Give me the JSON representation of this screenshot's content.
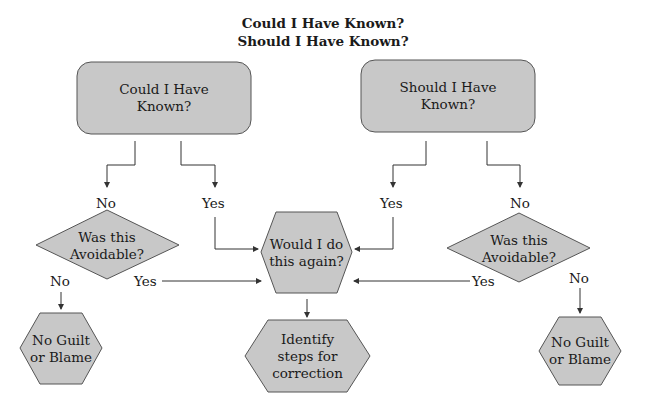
{
  "title": {
    "line1": "Could I Have Known?",
    "line2": "Should I Have Known?"
  },
  "colors": {
    "node_fill": "#c8c8c8",
    "node_stroke": "#555555",
    "line": "#333333",
    "background": "#ffffff"
  },
  "nodes": {
    "could_box": {
      "line1": "Could I Have",
      "line2": "Known?"
    },
    "should_box": {
      "line1": "Should I Have",
      "line2": "Known?"
    },
    "left_diamond": {
      "line1": "Was this",
      "line2": "Avoidable?"
    },
    "right_diamond": {
      "line1": "Was this",
      "line2": "Avoidable?"
    },
    "again_hex": {
      "line1": "Would I do",
      "line2": "this again?"
    },
    "identify_hex": {
      "line1": "Identify",
      "line2": "steps for",
      "line3": "correction"
    },
    "left_guilt_hex": {
      "line1": "No Guilt",
      "line2": "or Blame"
    },
    "right_guilt_hex": {
      "line1": "No Guilt",
      "line2": "or Blame"
    }
  },
  "labels": {
    "could_no": "No",
    "could_yes": "Yes",
    "should_yes": "Yes",
    "should_no": "No",
    "left_avoid_no": "No",
    "left_avoid_yes": "Yes",
    "right_avoid_yes": "Yes",
    "right_avoid_no": "No"
  }
}
